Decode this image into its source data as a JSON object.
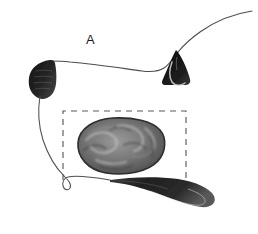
{
  "figure": {
    "panel_label": "A",
    "background_color": "#ffffff",
    "width": 258,
    "height": 234,
    "ink_color": "#2b2b2b",
    "outline_color": "#555555",
    "dashed_box_color": "#5a5a5a",
    "mass_dark": "#3a3a3a",
    "mass_mid": "#6e6e6e",
    "mass_light": "#a8a8a8",
    "wedge_color": "#111111",
    "lobe_color": "#1b1b1b",
    "tail_color": "#2a2a2a"
  },
  "annotations": {
    "dashed_region": {
      "name": "region-of-interest",
      "x": 63,
      "y": 111,
      "width": 123,
      "height": 69,
      "dash_pattern": "6 5"
    }
  },
  "structures": [
    {
      "name": "dorsal-contour",
      "description": "thin curved outline sweeping from upper right to the left lobe"
    },
    {
      "name": "left-dark-lobe",
      "description": "dark striated lobed structure at left margin"
    },
    {
      "name": "apical-wedge",
      "description": "dark triangular wedge with pale crescent at upper right"
    },
    {
      "name": "central-mass",
      "description": "textured gyrus-like mass inside the dashed region"
    },
    {
      "name": "ventral-contour",
      "description": "thin curve descending from the left lobe to a small loop"
    },
    {
      "name": "hooked-tail",
      "description": "dark recurved tail folding back toward the right"
    }
  ]
}
